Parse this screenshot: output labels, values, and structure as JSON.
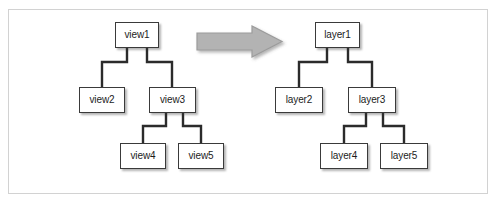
{
  "figure": {
    "kind": "diagram",
    "background_color": "#ffffff",
    "frame_border_color": "#d2d2d2",
    "node_fill_color": "#ffffff",
    "node_border_color": "#3a3a3a",
    "connector_color": "#2b2b2b",
    "arrow_fill_color": "#b3b3b3",
    "arrow_border_color": "#9a9a9a"
  },
  "left_tree": {
    "name": "view-hierarchy",
    "root": "view1",
    "nodes": [
      {
        "id": "view1",
        "label": "view1",
        "x": 115,
        "y": 22,
        "w": 44,
        "h": 26
      },
      {
        "id": "view2",
        "label": "view2",
        "x": 79,
        "y": 87,
        "w": 46,
        "h": 26
      },
      {
        "id": "view3",
        "label": "view3",
        "x": 149,
        "y": 87,
        "w": 47,
        "h": 26
      },
      {
        "id": "view4",
        "label": "view4",
        "x": 120,
        "y": 143,
        "w": 46,
        "h": 26
      },
      {
        "id": "view5",
        "label": "view5",
        "x": 178,
        "y": 143,
        "w": 46,
        "h": 26
      }
    ],
    "edges": [
      {
        "from": "view1",
        "to": "view2"
      },
      {
        "from": "view1",
        "to": "view3"
      },
      {
        "from": "view3",
        "to": "view4"
      },
      {
        "from": "view3",
        "to": "view5"
      }
    ]
  },
  "right_tree": {
    "name": "layer-hierarchy",
    "root": "layer1",
    "nodes": [
      {
        "id": "layer1",
        "label": "layer1",
        "x": 315,
        "y": 22,
        "w": 45,
        "h": 26
      },
      {
        "id": "layer2",
        "label": "layer2",
        "x": 275,
        "y": 87,
        "w": 48,
        "h": 26
      },
      {
        "id": "layer3",
        "label": "layer3",
        "x": 348,
        "y": 87,
        "w": 48,
        "h": 26
      },
      {
        "id": "layer4",
        "label": "layer4",
        "x": 320,
        "y": 143,
        "w": 48,
        "h": 26
      },
      {
        "id": "layer5",
        "label": "layer5",
        "x": 380,
        "y": 143,
        "w": 48,
        "h": 26
      }
    ],
    "edges": [
      {
        "from": "layer1",
        "to": "layer2"
      },
      {
        "from": "layer1",
        "to": "layer3"
      },
      {
        "from": "layer3",
        "to": "layer4"
      },
      {
        "from": "layer3",
        "to": "layer5"
      }
    ]
  },
  "arrow": {
    "name": "transform-arrow",
    "direction": "right",
    "x": 197,
    "y": 26,
    "w": 85,
    "h": 31
  }
}
